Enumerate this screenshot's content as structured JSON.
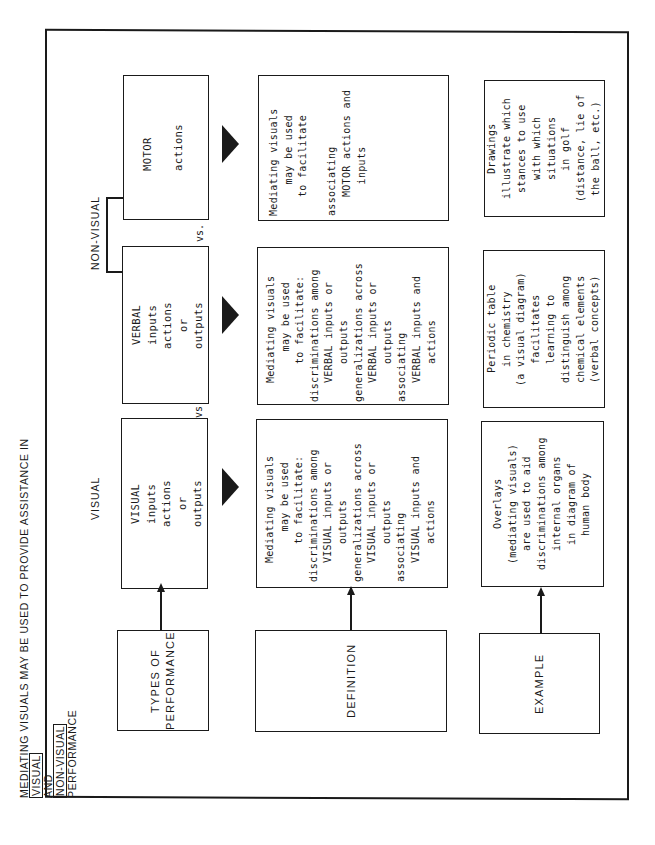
{
  "title": {
    "prefix": "MEDIATING VISUALS MAY BE USED TO PROVIDE ASSISTANCE IN",
    "boxed_1": "VISUAL",
    "middle": "AND",
    "boxed_2": "NON-VISUAL",
    "suffix": "PERFORMANCE"
  },
  "group_labels": {
    "visual": "VISUAL",
    "non_visual": "NON-VISUAL"
  },
  "separators": {
    "vs_1": "vs",
    "vs_2": "vs."
  },
  "row_labels": {
    "types": "TYPES OF\nPERFORMANCE",
    "definition": "DEFINITION",
    "example": "EXAMPLE"
  },
  "categories": [
    {
      "id": "visual",
      "text": "VISUAL\ninputs\nactions\nor\noutputs"
    },
    {
      "id": "verbal",
      "text": "VERBAL\ninputs\nactions\nor\noutputs"
    },
    {
      "id": "motor",
      "text": "MOTOR\n\nactions"
    }
  ],
  "definitions": [
    {
      "id": "visual",
      "text": "   Mediating visuals\n        may be used\n      to facilitate:\ndiscriminations among\n   VISUAL inputs or\n      outputs\ngeneralizations across\n   VISUAL inputs or\n      outputs\nassociating\n   VISUAL inputs and\n      actions"
    },
    {
      "id": "verbal",
      "text": "   Mediating visuals\n        may be used\n      to facilitate:\ndiscriminations among\n   VERBAL inputs or\n      outputs\ngeneralizations across\n   VERBAL inputs or\n      outputs\nassociating\n   VERBAL inputs and\n      actions"
    },
    {
      "id": "motor",
      "text": "Mediating visuals\n     may be used\n   to facilitate\n\nassociating\n   MOTOR actions and\n     inputs"
    }
  ],
  "examples": [
    {
      "id": "visual",
      "text": "Overlays\n(mediating visuals)\nare used to aid\ndiscriminations among\ninternal organs\nin diagram of\nhuman body"
    },
    {
      "id": "verbal",
      "text": "Periodic table\nin chemistry\n(a visual diagram)\nfacilitates\nlearning to\ndistinguish among\nchemical elements\n(verbal concepts)"
    },
    {
      "id": "motor",
      "text": "Drawings\nillustrate which\nstances to use\nwith which\nsituations\nin golf\n(distance, lie of\nthe ball, etc.)"
    }
  ],
  "colors": {
    "ink": "#1a1a1a",
    "paper": "#ffffff"
  }
}
